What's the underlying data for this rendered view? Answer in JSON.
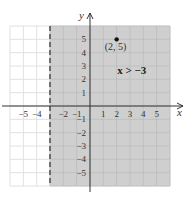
{
  "chart_data": {
    "type": "scatter",
    "title": "",
    "xlabel": "x",
    "ylabel": "y",
    "xlim": [
      -6,
      6
    ],
    "ylim": [
      -6,
      6
    ],
    "grid": true,
    "x_ticks": [
      "-5",
      "-4",
      "-2",
      "-1",
      "1",
      "2",
      "3",
      "4",
      "5"
    ],
    "y_ticks": [
      "5",
      "4",
      "3",
      "2",
      "1",
      "-1",
      "-2",
      "-3",
      "-4",
      "-5"
    ],
    "boundary": {
      "type": "vertical-dashed",
      "x": -3
    },
    "shaded_region": {
      "inequality": "x > -3",
      "color": "#cfcfcf"
    },
    "points": [
      {
        "x": 2,
        "y": 5,
        "label": "(2, 5)"
      }
    ],
    "annotations": [
      {
        "text": "x > −3",
        "x": 2.5,
        "y": 2.4
      }
    ]
  },
  "labels": {
    "x_axis": "x",
    "y_axis": "y",
    "inequality": "x > −3",
    "point": "(2, 5)"
  },
  "colors": {
    "shade": "#cfcfcf",
    "grid": "#e0e0e0",
    "grid_shaded": "#bdbdbd",
    "axis": "#333333"
  }
}
